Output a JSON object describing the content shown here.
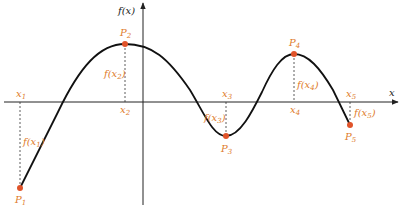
{
  "diagram": {
    "axes": {
      "x_label": "x",
      "y_label": "f(x)"
    },
    "colors": {
      "curve": "#111111",
      "point": "#e0532a",
      "label": "#e07b2a",
      "axis": "#222222"
    },
    "points": [
      {
        "name": "P",
        "sub": "1",
        "x_label": "x",
        "x_sub": "1",
        "f_label": "f(x",
        "f_sub": "1",
        "f_close": ")"
      },
      {
        "name": "P",
        "sub": "2",
        "x_label": "x",
        "x_sub": "2",
        "f_label": "f(x",
        "f_sub": "2",
        "f_close": ")"
      },
      {
        "name": "P",
        "sub": "3",
        "x_label": "x",
        "x_sub": "3",
        "f_label": "f(x",
        "f_sub": "3",
        "f_close": ")"
      },
      {
        "name": "P",
        "sub": "4",
        "x_label": "x",
        "x_sub": "4",
        "f_label": "f(x",
        "f_sub": "4",
        "f_close": ")"
      },
      {
        "name": "P",
        "sub": "5",
        "x_label": "x",
        "x_sub": "5",
        "f_label": "f(x",
        "f_sub": "5",
        "f_close": ")"
      }
    ]
  }
}
